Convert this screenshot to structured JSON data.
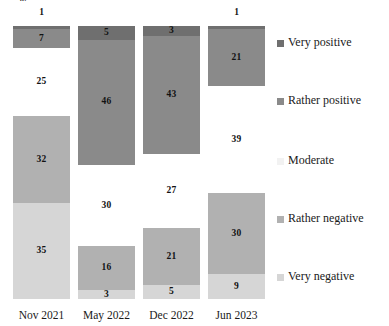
{
  "chart_data": {
    "type": "bar",
    "variant": "stacked-100-percent-vertical",
    "title": "",
    "subtitle": "",
    "xlabel": "",
    "ylabel": "",
    "ylim": [
      0,
      100
    ],
    "grid": false,
    "legend_position": "right",
    "categories": [
      "Nov 2021",
      "May 2022",
      "Dec 2022",
      "Jun 2023"
    ],
    "series": [
      {
        "name": "Very positive",
        "color": "#6f6f6f",
        "values": [
          1,
          5,
          3,
          1
        ]
      },
      {
        "name": "Rather positive",
        "color": "#8a8a8a",
        "values": [
          7,
          46,
          43,
          21
        ]
      },
      {
        "name": "Moderate",
        "color": "#ffffff",
        "values": [
          25,
          30,
          27,
          39
        ]
      },
      {
        "name": "Rather negative",
        "color": "#b1b1b1",
        "values": [
          32,
          16,
          21,
          30
        ]
      },
      {
        "name": "Very negative",
        "color": "#d6d6d6",
        "values": [
          35,
          3,
          5,
          9
        ]
      }
    ],
    "stack_order_top_to_bottom": [
      "Very positive",
      "Rather positive",
      "Moderate",
      "Rather negative",
      "Very negative"
    ]
  },
  "crop_fragment": "%",
  "bars": [
    {
      "tick": "Nov 2021",
      "outside_label": "1",
      "segments": [
        {
          "key": "vp",
          "value": 1,
          "label": "",
          "show": false
        },
        {
          "key": "rp",
          "value": 7,
          "label": "7",
          "show": true
        },
        {
          "key": "mo",
          "value": 25,
          "label": "25",
          "show": true
        },
        {
          "key": "rn",
          "value": 32,
          "label": "32",
          "show": true
        },
        {
          "key": "vn",
          "value": 35,
          "label": "35",
          "show": true
        }
      ]
    },
    {
      "tick": "May 2022",
      "outside_label": "",
      "segments": [
        {
          "key": "vp",
          "value": 5,
          "label": "5",
          "show": true
        },
        {
          "key": "rp",
          "value": 46,
          "label": "46",
          "show": true
        },
        {
          "key": "mo",
          "value": 30,
          "label": "30",
          "show": true
        },
        {
          "key": "rn",
          "value": 16,
          "label": "16",
          "show": true
        },
        {
          "key": "vn",
          "value": 3,
          "label": "3",
          "show": true
        }
      ]
    },
    {
      "tick": "Dec 2022",
      "outside_label": "",
      "segments": [
        {
          "key": "vp",
          "value": 3,
          "label": "3",
          "show": true
        },
        {
          "key": "rp",
          "value": 43,
          "label": "43",
          "show": true
        },
        {
          "key": "mo",
          "value": 27,
          "label": "27",
          "show": true
        },
        {
          "key": "rn",
          "value": 21,
          "label": "21",
          "show": true
        },
        {
          "key": "vn",
          "value": 5,
          "label": "5",
          "show": true
        }
      ]
    },
    {
      "tick": "Jun 2023",
      "outside_label": "1",
      "segments": [
        {
          "key": "vp",
          "value": 1,
          "label": "",
          "show": false
        },
        {
          "key": "rp",
          "value": 21,
          "label": "21",
          "show": true
        },
        {
          "key": "mo",
          "value": 39,
          "label": "39",
          "show": true
        },
        {
          "key": "rn",
          "value": 30,
          "label": "30",
          "show": true
        },
        {
          "key": "vn",
          "value": 9,
          "label": "9",
          "show": true
        }
      ]
    }
  ],
  "legend": {
    "items": [
      {
        "key": "vp",
        "label": "Very positive",
        "color": "#6f6f6f",
        "top": 36
      },
      {
        "key": "rp",
        "label": "Rather positive",
        "color": "#8a8a8a",
        "top": 94
      },
      {
        "key": "mo",
        "label": "Moderate",
        "color": "#f2f2f2",
        "top": 154
      },
      {
        "key": "rn",
        "label": "Rather negative",
        "color": "#b1b1b1",
        "top": 212
      },
      {
        "key": "vn",
        "label": "Very negative",
        "color": "#d6d6d6",
        "top": 270
      }
    ]
  }
}
